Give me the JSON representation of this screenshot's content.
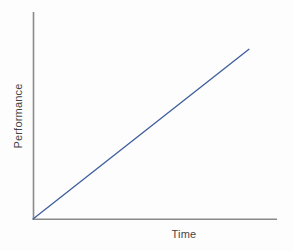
{
  "chart_data": {
    "type": "line",
    "title": "",
    "subtitle": "",
    "xlabel": "Time",
    "ylabel": "Performance",
    "x": [
      0,
      100
    ],
    "series": [
      {
        "name": "performance",
        "values": [
          0,
          100
        ],
        "color": "#3f5f9e"
      }
    ],
    "xlim": [
      0,
      113
    ],
    "ylim": [
      0,
      122
    ],
    "xticks": [],
    "yticks": [],
    "xticklabels": [],
    "yticklabels": [],
    "grid": false,
    "legend": false,
    "legend_position": "none",
    "annotations": [],
    "axis_color": "#8a8a8a",
    "background_color": "#fdfdfd",
    "text_color": "#464646"
  },
  "figure": {
    "ylabel_text": "Performance",
    "xlabel_text": "Time"
  }
}
